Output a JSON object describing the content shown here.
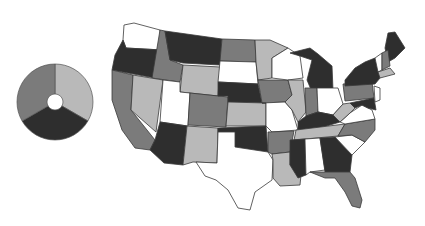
{
  "map": {
    "title": "",
    "type": "choropleth",
    "region": "contiguous-united-states",
    "shade_colors": {
      "white": "#ffffff",
      "light": "#b9b9b9",
      "medium": "#7b7b7b",
      "dark": "#2e2e2e"
    },
    "states": {
      "WA": "white",
      "OR": "dark",
      "CA": "medium",
      "ID": "medium",
      "NV": "light",
      "MT": "dark",
      "WY": "light",
      "UT": "white",
      "AZ": "dark",
      "CO": "medium",
      "NM": "light",
      "ND": "medium",
      "SD": "white",
      "NE": "dark",
      "KS": "light",
      "OK": "dark",
      "TX": "white",
      "MN": "light",
      "IA": "medium",
      "MO": "white",
      "AR": "medium",
      "LA": "light",
      "WI": "white",
      "IL": "light",
      "MI": "dark",
      "IN": "medium",
      "OH": "white",
      "KY": "dark",
      "TN": "light",
      "MS": "dark",
      "AL": "white",
      "GA": "dark",
      "FL": "medium",
      "SC": "white",
      "NC": "medium",
      "VA": "white",
      "WV": "light",
      "PA": "medium",
      "NY": "dark",
      "ME": "dark",
      "VT": "white",
      "NH": "medium",
      "MA": "light",
      "MD": "dark",
      "NJ": "white"
    }
  },
  "legend": {
    "type": "donut",
    "segments": [
      {
        "shade": "light",
        "color": "#b9b9b9",
        "share": 0.3333
      },
      {
        "shade": "dark",
        "color": "#2e2e2e",
        "share": 0.3333
      },
      {
        "shade": "medium",
        "color": "#7b7b7b",
        "share": 0.3334
      }
    ]
  }
}
